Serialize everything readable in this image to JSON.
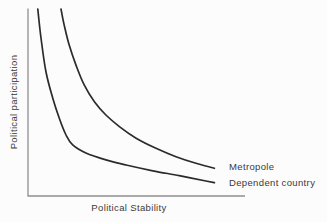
{
  "colors": {
    "background": "#fcfcfc",
    "curve": "#2b2b2b",
    "axis": "#8f8f8f",
    "text": "#3a3a3a"
  },
  "chart_data": {
    "type": "line",
    "title": "",
    "xlabel": "Political Stability",
    "ylabel": "Political participation",
    "x_axis": {
      "min": 0,
      "max": 1,
      "ticks": [],
      "numeric_labels_shown": false
    },
    "y_axis": {
      "min": 0,
      "max": 1,
      "ticks": [],
      "numeric_labels_shown": false
    },
    "grid": false,
    "legend_position": "labels-at-curve-ends-right",
    "series": [
      {
        "name": "Metropole",
        "points": [
          [
            0.152,
            1.0
          ],
          [
            0.167,
            0.914
          ],
          [
            0.19,
            0.807
          ],
          [
            0.221,
            0.7
          ],
          [
            0.259,
            0.594
          ],
          [
            0.306,
            0.504
          ],
          [
            0.359,
            0.433
          ],
          [
            0.421,
            0.371
          ],
          [
            0.498,
            0.309
          ],
          [
            0.59,
            0.255
          ],
          [
            0.682,
            0.21
          ],
          [
            0.774,
            0.175
          ],
          [
            0.859,
            0.148
          ]
        ]
      },
      {
        "name": "Dependent country",
        "points": [
          [
            0.045,
            1.0
          ],
          [
            0.06,
            0.845
          ],
          [
            0.083,
            0.663
          ],
          [
            0.114,
            0.524
          ],
          [
            0.144,
            0.417
          ],
          [
            0.175,
            0.326
          ],
          [
            0.206,
            0.273
          ],
          [
            0.267,
            0.23
          ],
          [
            0.359,
            0.193
          ],
          [
            0.452,
            0.166
          ],
          [
            0.575,
            0.135
          ],
          [
            0.697,
            0.109
          ],
          [
            0.82,
            0.08
          ],
          [
            0.859,
            0.071
          ]
        ]
      }
    ]
  }
}
